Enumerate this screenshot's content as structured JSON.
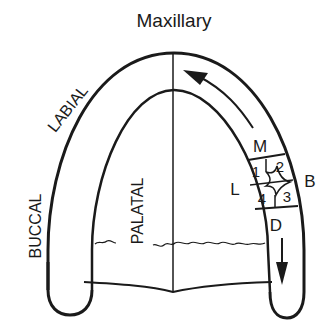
{
  "title": "Maxillary",
  "labels": {
    "labial": "LABIAL",
    "buccal": "BUCCAL",
    "palatal": "PALATAL",
    "mesial": "M",
    "distal": "D",
    "lingual": "L",
    "buccal_short": "B"
  },
  "quadrants": [
    "1",
    "2",
    "3",
    "4"
  ],
  "colors": {
    "ink": "#1a1a1a",
    "background": "#ffffff"
  }
}
